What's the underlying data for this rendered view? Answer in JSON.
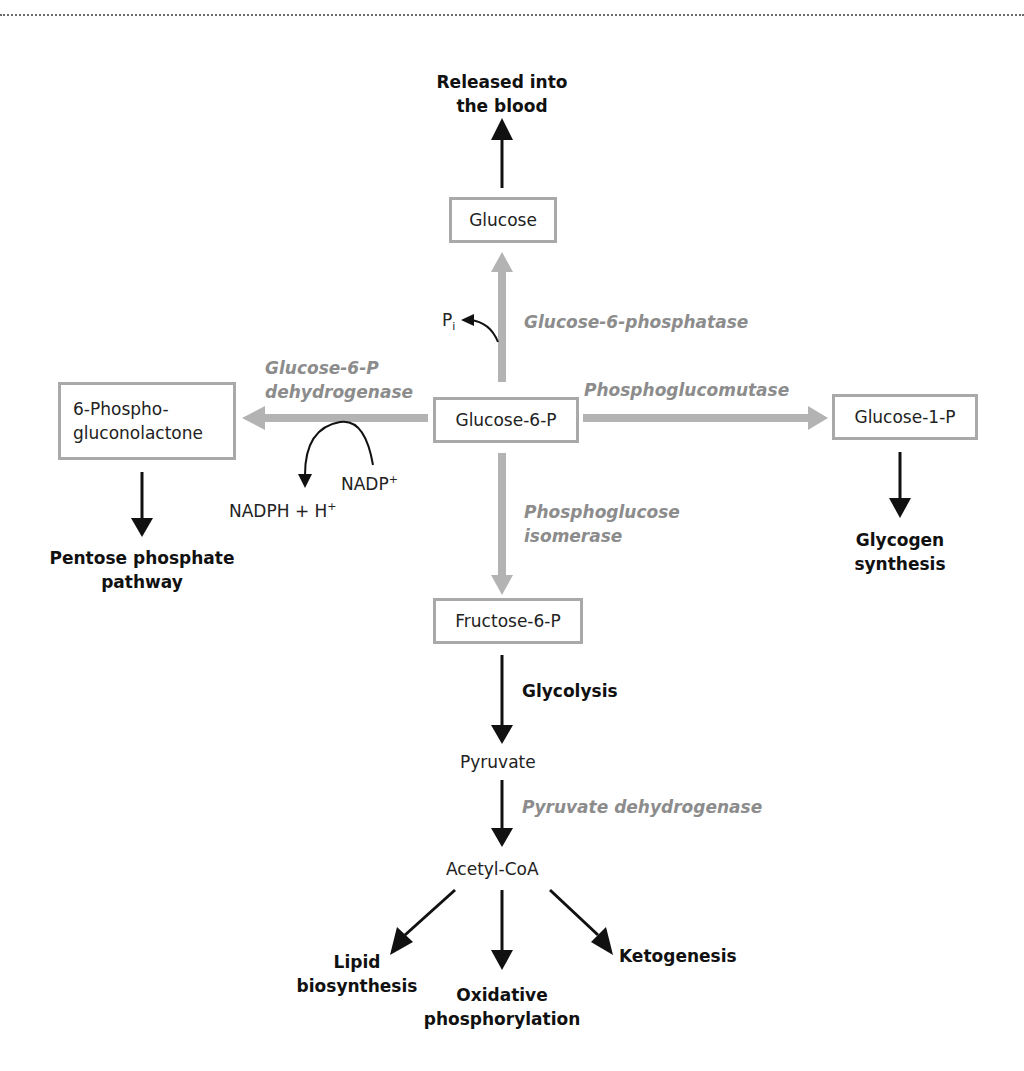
{
  "colors": {
    "enzyme_text": "#8c8c8c",
    "box_border": "#a9a9a9",
    "gray_arrow": "#b3b3b3",
    "black_arrow": "#111111"
  },
  "boxes": {
    "glucose": "Glucose",
    "glucose6p": "Glucose-6-P",
    "phosphogluconolactone_line1": "6-Phospho-",
    "phosphogluconolactone_line2": "gluconolactone",
    "glucose1p": "Glucose-1-P",
    "fructose6p": "Fructose-6-P"
  },
  "outcomes": {
    "blood_line1": "Released into",
    "blood_line2": "the blood",
    "pentose_line1": "Pentose phosphate",
    "pentose_line2": "pathway",
    "glycogen_line1": "Glycogen",
    "glycogen_line2": "synthesis",
    "glycolysis": "Glycolysis",
    "lipid_line1": "Lipid",
    "lipid_line2": "biosynthesis",
    "oxphos_line1": "Oxidative",
    "oxphos_line2": "phosphorylation",
    "ketogenesis": "Ketogenesis"
  },
  "enzymes": {
    "g6pase": "Glucose-6-phosphatase",
    "g6pdh_line1": "Glucose-6-P",
    "g6pdh_line2": "dehydrogenase",
    "pgm": "Phosphoglucomutase",
    "pgi_line1": "Phosphoglucose",
    "pgi_line2": "isomerase",
    "pdh": "Pyruvate dehydrogenase"
  },
  "metabolites": {
    "pi_base": "P",
    "pi_sub": "i",
    "nadp_base": "NADP",
    "nadp_sup": "+",
    "nadph_base": "NADPH + H",
    "nadph_sup": "+",
    "pyruvate": "Pyruvate",
    "acetylcoa": "Acetyl-CoA"
  }
}
